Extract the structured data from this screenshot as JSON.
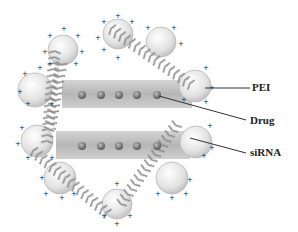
{
  "diagram": {
    "labels": {
      "pei": "PEI",
      "drug": "Drug",
      "sirna": "siRNA"
    },
    "colors": {
      "bar": "#b8b8b8",
      "drug_dot": "#7a7a7a",
      "sphere": "#e6e6e6",
      "helix": "#9a9a9a",
      "leader_line": "#333333"
    },
    "charge_symbol": "+"
  }
}
